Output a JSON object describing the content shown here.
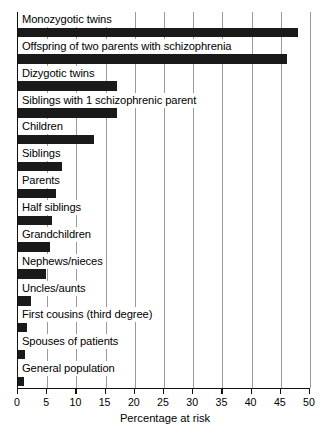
{
  "chart_data": {
    "type": "bar",
    "orientation": "horizontal",
    "title": "",
    "xlabel": "Percentage at risk",
    "ylabel": "",
    "xlim": [
      0,
      50
    ],
    "xticks": [
      0,
      5,
      10,
      15,
      20,
      25,
      30,
      35,
      40,
      45,
      50
    ],
    "grid": "vertical",
    "legend": "none",
    "bar_color": "#1a1a1a",
    "categories": [
      "Monozygotic twins",
      "Offspring of two parents with schizophrenia",
      "Dizygotic twins",
      "Siblings with 1 schizophrenic parent",
      "Children",
      "Siblings",
      "Parents",
      "Half siblings",
      "Grandchildren",
      "Nephews/nieces",
      "Uncles/aunts",
      "First cousins (third degree)",
      "Spouses of patients",
      "General population"
    ],
    "values": [
      48,
      46,
      17,
      17,
      13,
      7.5,
      6.5,
      5.8,
      5.5,
      4.8,
      2.2,
      1.5,
      1.2,
      1
    ]
  },
  "axis": {
    "tick_labels": [
      "0",
      "5",
      "10",
      "15",
      "20",
      "25",
      "30",
      "35",
      "40",
      "45",
      "50"
    ],
    "x_axis_title": "Percentage at risk"
  }
}
